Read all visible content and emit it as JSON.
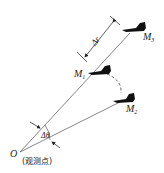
{
  "diagram": {
    "origin_label": "O",
    "origin_note": "(观测点)",
    "points": [
      {
        "id": "M3",
        "name": "M",
        "sub": "3"
      },
      {
        "id": "M1",
        "name": "M",
        "sub": "1"
      },
      {
        "id": "M2",
        "name": "M",
        "sub": "2"
      }
    ],
    "range_label": "Δr",
    "angle_label": "Δθ",
    "colors": {
      "line": "#555555",
      "plane": "#111111",
      "text": "#222222"
    }
  }
}
